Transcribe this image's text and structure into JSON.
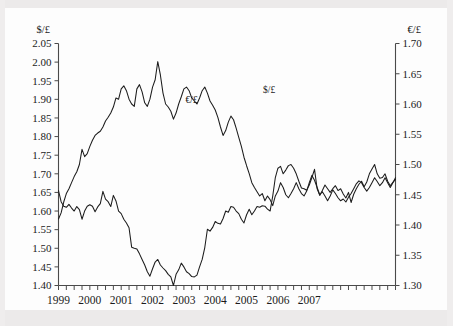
{
  "chart_data": {
    "type": "line",
    "title": "",
    "subtitle": "",
    "xlabel": "",
    "ylabel": "$/£",
    "y2label": "€/£",
    "grid": false,
    "legend_position": "in-plot-annotations",
    "annotations": [
      {
        "text": "€/£",
        "x_frac": 0.395,
        "y_frac": 0.245,
        "series": "EUR/GBP"
      },
      {
        "text": "$/£",
        "x_frac": 0.625,
        "y_frac": 0.205,
        "series": "USD/GBP"
      }
    ],
    "x_axis": {
      "ticks": [
        "1999",
        "2000",
        "2001",
        "2002",
        "2003",
        "2004",
        "2005",
        "2006",
        "2007"
      ],
      "minor_ticks_per_interval": 4,
      "range": [
        "1999-01",
        "2007-10"
      ]
    },
    "left_axis": {
      "label": "$/£",
      "ticks": [
        "1.40",
        "1.45",
        "1.50",
        "1.55",
        "1.60",
        "1.65",
        "1.70",
        "1.75",
        "1.80",
        "1.85",
        "1.90",
        "1.95",
        "2.00",
        "2.05"
      ],
      "min": 1.4,
      "max": 2.05
    },
    "right_axis": {
      "label": "€/£",
      "ticks": [
        "1.30",
        "1.35",
        "1.40",
        "1.45",
        "1.50",
        "1.55",
        "1.60",
        "1.65",
        "1.70"
      ],
      "min": 1.3,
      "max": 1.7
    },
    "series": [
      {
        "name": "USD/GBP",
        "label": "$/£",
        "axis": "left",
        "color": "#1c1c1c",
        "values": [
          1.655,
          1.625,
          1.613,
          1.61,
          1.618,
          1.608,
          1.6,
          1.612,
          1.604,
          1.578,
          1.6,
          1.613,
          1.617,
          1.613,
          1.598,
          1.611,
          1.62,
          1.653,
          1.632,
          1.625,
          1.612,
          1.642,
          1.627,
          1.6,
          1.593,
          1.578,
          1.568,
          1.555,
          1.503,
          1.5,
          1.498,
          1.485,
          1.47,
          1.455,
          1.437,
          1.425,
          1.445,
          1.463,
          1.47,
          1.455,
          1.447,
          1.44,
          1.43,
          1.423,
          1.4,
          1.43,
          1.442,
          1.46,
          1.45,
          1.437,
          1.432,
          1.424,
          1.423,
          1.428,
          1.45,
          1.47,
          1.502,
          1.551,
          1.546,
          1.556,
          1.572,
          1.567,
          1.565,
          1.58,
          1.6,
          1.597,
          1.612,
          1.61,
          1.6,
          1.593,
          1.578,
          1.568,
          1.59,
          1.605,
          1.59,
          1.6,
          1.612,
          1.61,
          1.614,
          1.613,
          1.605,
          1.6,
          1.64,
          1.69,
          1.715,
          1.72,
          1.7,
          1.71,
          1.722,
          1.725,
          1.715,
          1.7,
          1.68,
          1.662,
          1.66,
          1.656,
          1.67,
          1.69,
          1.712,
          1.66,
          1.642,
          1.655,
          1.67,
          1.66,
          1.65,
          1.66,
          1.668,
          1.655,
          1.66,
          1.646,
          1.635,
          1.65,
          1.623,
          1.645,
          1.66,
          1.672,
          1.68,
          1.665,
          1.678,
          1.7,
          1.713,
          1.725,
          1.7,
          1.688,
          1.69,
          1.7,
          1.68,
          1.668,
          1.677,
          1.685
        ]
      },
      {
        "name": "EUR/GBP",
        "label": "€/£",
        "axis": "right",
        "color": "#1c1c1c",
        "values": [
          1.41,
          1.42,
          1.438,
          1.452,
          1.46,
          1.47,
          1.48,
          1.488,
          1.5,
          1.525,
          1.513,
          1.518,
          1.53,
          1.54,
          1.548,
          1.552,
          1.555,
          1.562,
          1.572,
          1.578,
          1.585,
          1.595,
          1.61,
          1.608,
          1.625,
          1.63,
          1.622,
          1.608,
          1.6,
          1.596,
          1.625,
          1.632,
          1.62,
          1.602,
          1.596,
          1.608,
          1.628,
          1.64,
          1.67,
          1.648,
          1.618,
          1.6,
          1.595,
          1.588,
          1.575,
          1.585,
          1.6,
          1.612,
          1.625,
          1.628,
          1.622,
          1.61,
          1.605,
          1.6,
          1.61,
          1.622,
          1.628,
          1.618,
          1.605,
          1.598,
          1.59,
          1.578,
          1.562,
          1.548,
          1.556,
          1.57,
          1.58,
          1.574,
          1.56,
          1.545,
          1.53,
          1.512,
          1.498,
          1.485,
          1.47,
          1.462,
          1.455,
          1.448,
          1.452,
          1.44,
          1.448,
          1.442,
          1.432,
          1.448,
          1.456,
          1.47,
          1.462,
          1.45,
          1.445,
          1.452,
          1.46,
          1.47,
          1.46,
          1.452,
          1.448,
          1.456,
          1.47,
          1.482,
          1.474,
          1.462,
          1.45,
          1.455,
          1.448,
          1.44,
          1.448,
          1.458,
          1.452,
          1.445,
          1.44,
          1.443,
          1.438,
          1.446,
          1.452,
          1.46,
          1.468,
          1.473,
          1.47,
          1.462,
          1.456,
          1.462,
          1.47,
          1.478,
          1.472,
          1.465,
          1.47,
          1.478,
          1.47,
          1.462,
          1.47,
          1.478
        ]
      }
    ]
  }
}
